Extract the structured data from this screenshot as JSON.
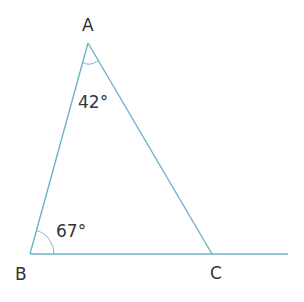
{
  "diagram": {
    "type": "triangle",
    "line_color": "#6bb3cc",
    "text_color": "#333333",
    "vertices": {
      "A": {
        "label": "A"
      },
      "B": {
        "label": "B"
      },
      "C": {
        "label": "C"
      }
    },
    "angles": {
      "A": {
        "label": "42°"
      },
      "B": {
        "label": "67°"
      }
    }
  }
}
